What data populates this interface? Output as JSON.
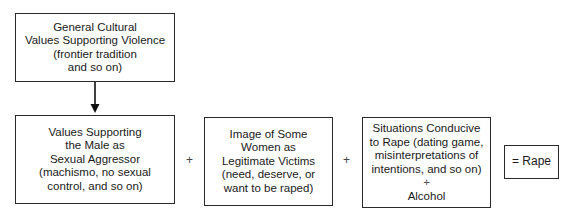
{
  "diagram": {
    "top_box": {
      "lines": [
        "General Cultural",
        "Values Supporting Violence",
        "(frontier tradition",
        "and so on)"
      ]
    },
    "box_male_aggressor": {
      "lines": [
        "Values Supporting",
        "the Male as",
        "Sexual Aggressor",
        "(machismo, no sexual",
        "control, and so on)"
      ]
    },
    "box_legitimate_victims": {
      "lines": [
        "Image of Some",
        "Women as",
        "Legitimate Victims",
        "(need, deserve, or",
        "want to be raped)"
      ]
    },
    "box_situations": {
      "lines": [
        "Situations Conducive",
        "to Rape (dating game,",
        "misinterpretations of",
        "intentions, and so on)",
        "+",
        "Alcohol"
      ]
    },
    "result_box": {
      "label": "= Rape"
    },
    "operators": [
      "+",
      "+"
    ]
  }
}
